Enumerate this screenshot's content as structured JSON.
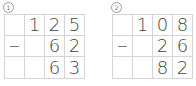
{
  "problems": [
    {
      "label": "1",
      "rows": [
        [
          "",
          "1",
          "2",
          "5"
        ],
        [
          "−",
          "",
          "6",
          "2"
        ],
        [
          "",
          "",
          "6",
          "3"
        ]
      ]
    },
    {
      "label": "2",
      "rows": [
        [
          "",
          "1",
          "0",
          "8"
        ],
        [
          "−",
          "",
          "2",
          "6"
        ],
        [
          "",
          "",
          "8",
          "2"
        ]
      ]
    }
  ]
}
